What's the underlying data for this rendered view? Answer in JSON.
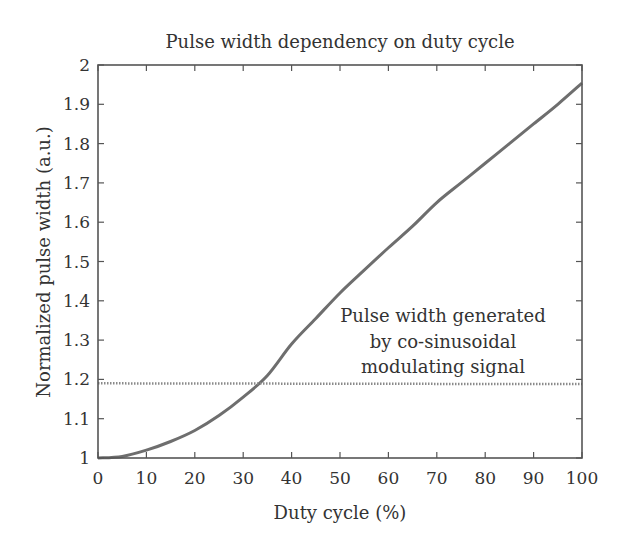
{
  "chart_data": {
    "type": "line",
    "title": "Pulse width dependency on duty cycle",
    "xlabel": "Duty cycle (%)",
    "ylabel": "Normalized pulse width (a.u.)",
    "xlim": [
      0,
      100
    ],
    "ylim": [
      1,
      2
    ],
    "xticks": [
      "0",
      "10",
      "20",
      "30",
      "40",
      "50",
      "60",
      "70",
      "80",
      "90",
      "100"
    ],
    "yticks": [
      "1",
      "1.1",
      "1.2",
      "1.3",
      "1.4",
      "1.5",
      "1.6",
      "1.7",
      "1.8",
      "1.9",
      "2"
    ],
    "grid": false,
    "series": [
      {
        "name": "Pulse width",
        "style": "solid",
        "color": "#6e6e6e",
        "x": [
          0,
          5,
          10,
          15,
          20,
          25,
          30,
          35,
          40,
          45,
          50,
          55,
          60,
          65,
          70,
          75,
          80,
          85,
          90,
          95,
          100
        ],
        "values": [
          1.0,
          1.004,
          1.02,
          1.042,
          1.07,
          1.108,
          1.155,
          1.21,
          1.29,
          1.355,
          1.42,
          1.478,
          1.535,
          1.59,
          1.65,
          1.7,
          1.75,
          1.8,
          1.85,
          1.9,
          1.954
        ]
      },
      {
        "name": "Pulse width generated by co-sinusoidal modulating signal",
        "style": "dotted",
        "color": "#8a8a8a",
        "x": [
          0,
          100
        ],
        "values": [
          1.19,
          1.188
        ]
      }
    ],
    "annotations": [
      {
        "lines": [
          "Pulse width generated",
          "by co-sinusoidal",
          "modulating signal"
        ],
        "x": 70,
        "y": 1.33
      }
    ]
  }
}
